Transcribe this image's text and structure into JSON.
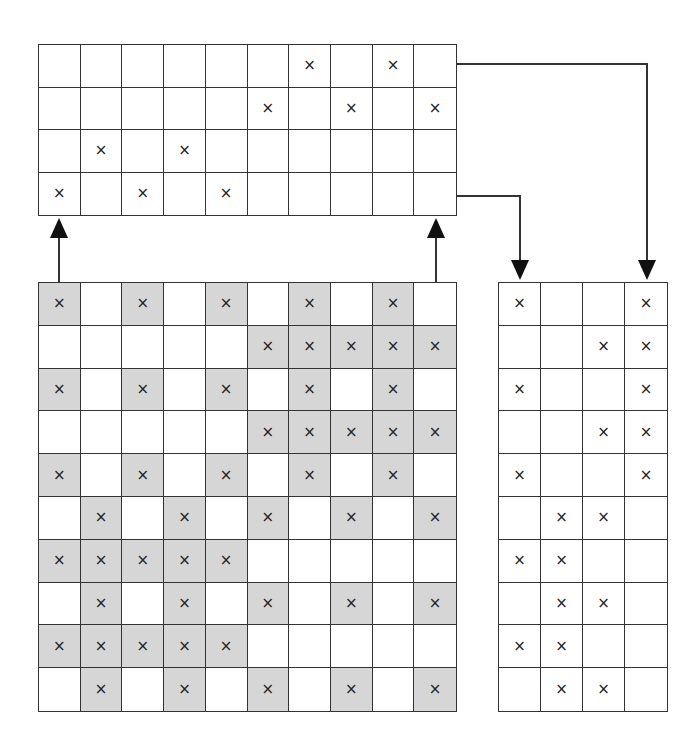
{
  "colors": {
    "line": "#333333",
    "shaded": "#d6d6d6",
    "mark": "#222222",
    "background": "#ffffff"
  },
  "mark_glyph": "×",
  "top_grid": {
    "rows": 4,
    "cols": 10,
    "box": {
      "x": 38,
      "y": 44,
      "w": 419,
      "h": 172
    },
    "marks": [
      [
        6,
        8
      ],
      [
        5,
        7,
        9
      ],
      [
        1,
        3
      ],
      [
        0,
        2,
        4
      ]
    ]
  },
  "main_grid": {
    "rows": 10,
    "cols": 10,
    "box": {
      "x": 38,
      "y": 282,
      "w": 419,
      "h": 430
    },
    "marked_shaded": [
      [
        0,
        2,
        4,
        6,
        8
      ],
      [
        5,
        6,
        7,
        8,
        9
      ],
      [
        0,
        2,
        4,
        6,
        8
      ],
      [
        5,
        6,
        7,
        8,
        9
      ],
      [
        0,
        2,
        4,
        6,
        8
      ],
      [
        1,
        3,
        5,
        7,
        9
      ],
      [
        0,
        1,
        2,
        3,
        4
      ],
      [
        1,
        3,
        5,
        7,
        9
      ],
      [
        0,
        1,
        2,
        3,
        4
      ],
      [
        1,
        3,
        5,
        7,
        9
      ]
    ]
  },
  "right_grid": {
    "rows": 10,
    "cols": 4,
    "box": {
      "x": 498,
      "y": 282,
      "w": 170,
      "h": 430
    },
    "marks": [
      [
        0,
        3
      ],
      [
        2,
        3
      ],
      [
        0,
        3
      ],
      [
        2,
        3
      ],
      [
        0,
        3
      ],
      [
        1,
        2
      ],
      [
        0,
        1
      ],
      [
        1,
        2
      ],
      [
        0,
        1
      ],
      [
        1,
        2
      ]
    ]
  },
  "arrows": [
    {
      "name": "up-arrow-left",
      "points": [
        [
          59,
          282
        ],
        [
          59,
          218
        ]
      ],
      "head": "end"
    },
    {
      "name": "up-arrow-right",
      "points": [
        [
          436,
          282
        ],
        [
          436,
          218
        ]
      ],
      "head": "end"
    },
    {
      "name": "connector-short",
      "points": [
        [
          457,
          196
        ],
        [
          520,
          196
        ],
        [
          520,
          280
        ]
      ],
      "head": "end"
    },
    {
      "name": "connector-long",
      "points": [
        [
          457,
          64
        ],
        [
          647,
          64
        ],
        [
          647,
          280
        ]
      ],
      "head": "end"
    }
  ]
}
